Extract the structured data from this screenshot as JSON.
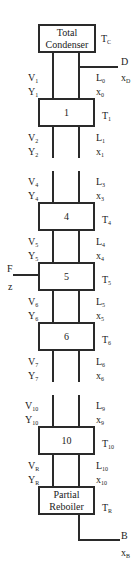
{
  "diagram": {
    "type": "distillation-column",
    "condenser": {
      "line1": "Total",
      "line2": "Condenser",
      "temp": "T",
      "temp_sub": "C"
    },
    "distillate": {
      "name": "D",
      "comp": "x",
      "comp_sub": "D"
    },
    "feed": {
      "name": "F",
      "comp": "z"
    },
    "bottoms": {
      "name": "B",
      "comp": "x",
      "comp_sub": "B"
    },
    "reboiler": {
      "line1": "Partial",
      "line2": "Reboiler",
      "temp": "T",
      "temp_sub": "R"
    },
    "stages": [
      {
        "label": "1",
        "temp_sub": "1"
      },
      {
        "label": "4",
        "temp_sub": "4"
      },
      {
        "label": "5",
        "temp_sub": "5"
      },
      {
        "label": "6",
        "temp_sub": "6"
      },
      {
        "label": "10",
        "temp_sub": "10"
      }
    ],
    "streams": [
      {
        "V": "1",
        "Y": "1",
        "L": "0",
        "x": "0"
      },
      {
        "V": "2",
        "Y": "2",
        "L": "1",
        "x": "1"
      },
      {
        "V": "4",
        "Y": "4",
        "L": "3",
        "x": "3"
      },
      {
        "V": "5",
        "Y": "5",
        "L": "4",
        "x": "4"
      },
      {
        "V": "6",
        "Y": "6",
        "L": "5",
        "x": "5"
      },
      {
        "V": "7",
        "Y": "7",
        "L": "6",
        "x": "6"
      },
      {
        "V": "10",
        "Y": "10",
        "L": "9",
        "x": "9"
      },
      {
        "V": "R",
        "Y": "R",
        "L": "10",
        "x": "10"
      }
    ],
    "letters": {
      "V": "V",
      "Y": "Y",
      "L": "L",
      "x": "x",
      "T": "T"
    }
  }
}
